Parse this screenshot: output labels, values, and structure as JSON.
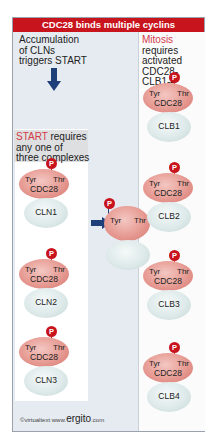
{
  "title": "CDC28 binds multiple cyclins",
  "left": {
    "intro_lines": [
      "Accumulation",
      "of CLNs",
      "triggers START"
    ],
    "start_req": {
      "highlight": "START",
      "rest": " requires",
      "line2": "any one of",
      "line3": "three complexes"
    },
    "complexes": [
      {
        "kinase": "CDC28",
        "tyr": "Tyr",
        "thr": "Thr",
        "phospho": "P",
        "cyclin": "CLN1"
      },
      {
        "kinase": "CDC28",
        "tyr": "Tyr",
        "thr": "Thr",
        "phospho": "P",
        "cyclin": "CLN2"
      },
      {
        "kinase": "CDC28",
        "tyr": "Tyr",
        "thr": "Thr",
        "phospho": "P",
        "cyclin": "CLN3"
      }
    ]
  },
  "middle": {
    "tyr": "Tyr",
    "thr": "Thr",
    "phospho": "P"
  },
  "right": {
    "req": {
      "highlight": "Mitosis",
      "rest": " requires",
      "line2": "activated",
      "line3": "CDC28-CLB1-4"
    },
    "complexes": [
      {
        "kinase": "CDC28",
        "tyr": "Tyr",
        "thr": "Thr",
        "phospho": "P",
        "cyclin": "CLB1"
      },
      {
        "kinase": "CDC28",
        "tyr": "Tyr",
        "thr": "Thr",
        "phospho": "P",
        "cyclin": "CLB2"
      },
      {
        "kinase": "CDC28",
        "tyr": "Tyr",
        "thr": "Thr",
        "phospho": "P",
        "cyclin": "CLB3"
      },
      {
        "kinase": "CDC28",
        "tyr": "Tyr",
        "thr": "Thr",
        "phospho": "P",
        "cyclin": "CLB4"
      }
    ]
  },
  "footer": {
    "copyright": "©virtualtext",
    "www": "www.",
    "site": "ergito",
    "tld": ".com"
  },
  "colors": {
    "title_bg": "#c8141c",
    "highlight": "#d33a48",
    "arrow": "#1f3f7a"
  }
}
